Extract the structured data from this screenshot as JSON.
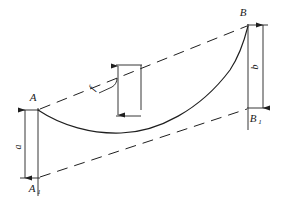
{
  "figure": {
    "type": "engineering-diagram",
    "background_color": "#ffffff",
    "line_color": "#1f1f1f"
  },
  "labels": {
    "point_a": "A",
    "point_a1_base": "A",
    "point_a1_sub": "1",
    "point_b": "B",
    "point_b1_base": "B",
    "point_b1_sub": "1",
    "dim_a": "a",
    "dim_b": "b",
    "dim_f": "f"
  },
  "geometry": {
    "point_a": {
      "x": 38,
      "y": 110
    },
    "point_a1": {
      "x": 38,
      "y": 178
    },
    "point_b": {
      "x": 248,
      "y": 25
    },
    "point_b1": {
      "x": 248,
      "y": 108
    },
    "curve_low_point": {
      "x": 120,
      "y": 133
    },
    "sag_station_x": 118,
    "sag_top": {
      "x": 118,
      "y": 66
    },
    "sag_bottom": {
      "x": 118,
      "y": 115
    },
    "chord_upper": "A to B (dashed)",
    "chord_lower": "A1 to B1 (dashed)"
  },
  "dimensions": [
    {
      "name": "a",
      "from": "A",
      "to": "A1",
      "side": "left",
      "orientation": "vertical"
    },
    {
      "name": "b",
      "from": "B",
      "to": "B1",
      "side": "right",
      "orientation": "vertical"
    },
    {
      "name": "f",
      "from": "upper chord",
      "to": "cable curve",
      "side": "middle",
      "orientation": "vertical"
    }
  ]
}
